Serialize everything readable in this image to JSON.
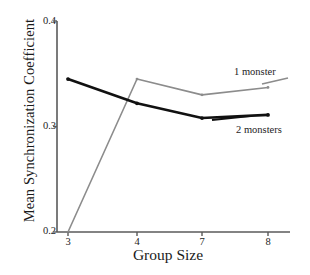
{
  "chart_data": {
    "type": "line",
    "title": "",
    "subtitle": "",
    "xlabel": "Group Size",
    "ylabel": "Mean Synchronization Coefficient",
    "categories": [
      "3",
      "4",
      "7",
      "8"
    ],
    "x": [
      3,
      4,
      7,
      8
    ],
    "xtick_labels": [
      "3",
      "4",
      "7",
      "8"
    ],
    "ytick_labels": [
      "0.2",
      "0.3",
      "0.4"
    ],
    "yticks": [
      0.2,
      0.3,
      0.4
    ],
    "ylim": [
      0.2,
      0.4
    ],
    "grid": false,
    "legend_position": "inline-annotation",
    "series": [
      {
        "name": "1 monster",
        "color": "#8c8c8c",
        "values": [
          0.2,
          0.345,
          0.33,
          0.337
        ],
        "annotation": "1 monster"
      },
      {
        "name": "2 monsters",
        "color": "#111111",
        "values": [
          0.345,
          0.322,
          0.308,
          0.311
        ],
        "annotation": "2 monsters"
      }
    ],
    "annotations": [
      {
        "text": "1 monster",
        "series": "1 monster"
      },
      {
        "text": "2 monsters",
        "series": "2 monsters"
      }
    ]
  },
  "axis": {
    "y_title": "Mean Synchronization Coefficient",
    "x_title": "Group Size",
    "y_ticks": [
      {
        "label": "0.4",
        "value": 0.4
      },
      {
        "label": "0.3",
        "value": 0.3
      },
      {
        "label": "0.2",
        "value": 0.2
      }
    ],
    "x_ticks": [
      {
        "label": "3",
        "value": 3
      },
      {
        "label": "4",
        "value": 4
      },
      {
        "label": "7",
        "value": 7
      },
      {
        "label": "8",
        "value": 8
      }
    ]
  },
  "colors": {
    "background": "#ffffff",
    "axis": "#5a5a5a",
    "series_1_monster": "#8c8c8c",
    "series_2_monsters": "#111111",
    "text": "#1a1a1a"
  }
}
